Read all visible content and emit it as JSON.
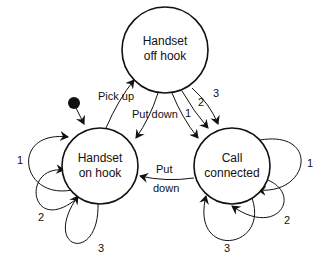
{
  "diagram": {
    "type": "state-machine",
    "states": [
      {
        "id": "off_hook",
        "line1": "Handset",
        "line2": "off hook"
      },
      {
        "id": "on_hook",
        "line1": "Handset",
        "line2": "on hook"
      },
      {
        "id": "connected",
        "line1": "Call",
        "line2": "connected"
      }
    ],
    "transitions": {
      "pick_up": "Pick up",
      "put_down_top": "Put down",
      "dial_1": "1",
      "dial_2": "2",
      "dial_3": "3",
      "put_down_bottom_1": "Put",
      "put_down_bottom_2": "down",
      "on_hook_loop_1": "1",
      "on_hook_loop_2": "2",
      "on_hook_loop_3": "3",
      "connected_loop_1": "1",
      "connected_loop_2": "2",
      "connected_loop_3": "3"
    },
    "colors": {
      "stroke": "#111111",
      "background": "#ffffff"
    }
  }
}
